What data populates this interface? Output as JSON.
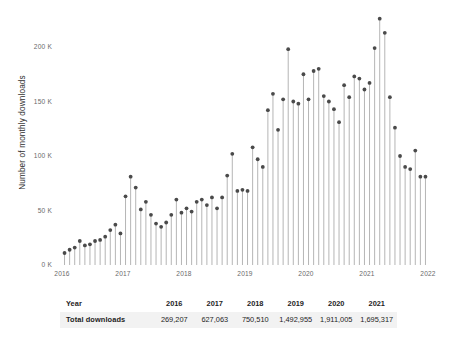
{
  "chart_data": {
    "type": "line",
    "subtype": "stem",
    "title": "",
    "xlabel": "",
    "ylabel": "Number of monthly downloads",
    "ylim": [
      0,
      232000
    ],
    "xlim": [
      2016.0,
      2022.0
    ],
    "grid": false,
    "legend": "none",
    "ytick_labels": [
      "0 K",
      "50 K",
      "100 K",
      "150 K",
      "200 K"
    ],
    "ytick_values": [
      0,
      50000,
      100000,
      150000,
      200000
    ],
    "xtick_labels": [
      "2016",
      "2017",
      "2018",
      "2019",
      "2020",
      "2021",
      "2022"
    ],
    "xtick_values": [
      2016,
      2017,
      2018,
      2019,
      2020,
      2021,
      2022
    ],
    "x_unit": "month",
    "series": [
      {
        "name": "Monthly downloads",
        "marker_color": "#4a4a4a",
        "stem_color": "#b5b5b5",
        "x": [
          "2016-01",
          "2016-02",
          "2016-03",
          "2016-04",
          "2016-05",
          "2016-06",
          "2016-07",
          "2016-08",
          "2016-09",
          "2016-10",
          "2016-11",
          "2016-12",
          "2017-01",
          "2017-02",
          "2017-03",
          "2017-04",
          "2017-05",
          "2017-06",
          "2017-07",
          "2017-08",
          "2017-09",
          "2017-10",
          "2017-11",
          "2017-12",
          "2018-01",
          "2018-02",
          "2018-03",
          "2018-04",
          "2018-05",
          "2018-06",
          "2018-07",
          "2018-08",
          "2018-09",
          "2018-10",
          "2018-11",
          "2018-12",
          "2019-01",
          "2019-02",
          "2019-03",
          "2019-04",
          "2019-05",
          "2019-06",
          "2019-07",
          "2019-08",
          "2019-09",
          "2019-10",
          "2019-11",
          "2019-12",
          "2020-01",
          "2020-02",
          "2020-03",
          "2020-04",
          "2020-05",
          "2020-06",
          "2020-07",
          "2020-08",
          "2020-09",
          "2020-10",
          "2020-11",
          "2020-12",
          "2021-01",
          "2021-02",
          "2021-03",
          "2021-04",
          "2021-05",
          "2021-06",
          "2021-07",
          "2021-08",
          "2021-09",
          "2021-10",
          "2021-11",
          "2021-12"
        ],
        "values": [
          11000,
          14000,
          16000,
          22000,
          18000,
          19000,
          22000,
          23000,
          26000,
          32000,
          37000,
          29000,
          63000,
          81000,
          71000,
          51000,
          58000,
          46000,
          38000,
          35000,
          39000,
          46000,
          60000,
          48000,
          52000,
          49000,
          58000,
          60000,
          55000,
          62000,
          52000,
          62000,
          82000,
          102000,
          68000,
          69000,
          68000,
          108000,
          97000,
          90000,
          142000,
          157000,
          124000,
          152000,
          198000,
          150000,
          148000,
          175000,
          152000,
          178000,
          180000,
          155000,
          150000,
          143000,
          131000,
          165000,
          154000,
          173000,
          171000,
          161000,
          167000,
          199000,
          226000,
          213000,
          154000,
          126000,
          100000,
          90000,
          88000,
          105000,
          81000,
          81000
        ]
      }
    ],
    "annotations": []
  },
  "table": {
    "rows": [
      {
        "label": "Year",
        "values": [
          "2016",
          "2017",
          "2018",
          "2019",
          "2020",
          "2021"
        ]
      },
      {
        "label": "Total downloads",
        "values": [
          "269,207",
          "627,063",
          "750,510",
          "1,492,955",
          "1,911,005",
          "1,695,317"
        ]
      }
    ]
  },
  "colors": {
    "marker": "#4a4a4a",
    "stem": "#b5b5b5",
    "tick_text": "#6a6a6a",
    "axis_text": "#2e2e2e",
    "table_band": "#f2f2f2",
    "background": "#ffffff"
  }
}
